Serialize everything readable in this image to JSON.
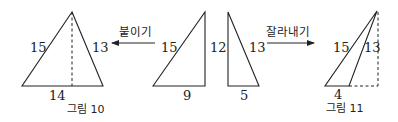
{
  "figures": [
    {
      "caption": "그림 10",
      "triangle_labels": {
        "left": "15",
        "right": "13",
        "base": "14"
      }
    },
    {
      "caption": "그림 11",
      "triangle_labels": {
        "left": "15",
        "right": "13",
        "base": "4"
      }
    }
  ],
  "pieces": {
    "right_triangle_a": {
      "hypotenuse": "15",
      "height": "12",
      "base": "9"
    },
    "right_triangle_b": {
      "hypotenuse": "13",
      "base": "5"
    }
  },
  "arrows": {
    "attach": {
      "label": "붙이기",
      "direction": "left"
    },
    "cut": {
      "label": "잘라내기",
      "direction": "right"
    }
  },
  "colors": {
    "stroke": "#222222",
    "background": "#ffffff"
  }
}
